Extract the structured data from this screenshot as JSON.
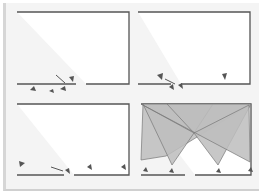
{
  "figure": {
    "panels": [
      {
        "id": "top-left",
        "description": "room outline with camera cluster at gap on bottom wall",
        "camera_labels": [
          "1",
          "2",
          "3",
          "4"
        ]
      },
      {
        "id": "top-right",
        "description": "room outline with cameras near bottom-left and bottom-right",
        "camera_labels": [
          "1",
          "2",
          "3",
          "4"
        ]
      },
      {
        "id": "bottom-left",
        "description": "room outline with cameras placed along bottom wall",
        "camera_labels": [
          "1",
          "2",
          "3",
          "4"
        ]
      },
      {
        "id": "bottom-right",
        "description": "room with four camera coverage cones shaded gray",
        "camera_labels": [
          "1",
          "2",
          "3",
          "4"
        ]
      }
    ],
    "colors": {
      "background": "#f4f4f4",
      "room_fill": "#ffffff",
      "wall": "#555555",
      "coverage": "#bdbdbd",
      "coverage_edge": "#777777"
    }
  }
}
